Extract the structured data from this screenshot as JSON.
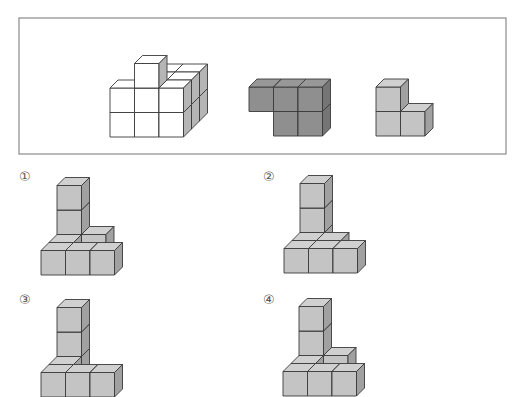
{
  "problem": {
    "given_box": {
      "x": 19,
      "y": 18,
      "width": 487,
      "height": 136,
      "stroke": "#8a8a8a"
    },
    "cube": {
      "width": 24.5,
      "height": 24.5,
      "depth_dx": 8,
      "depth_dy": 8
    },
    "given_pieces": [
      {
        "name": "white-pyramid-structure",
        "fill": "#ffffff",
        "origin": {
          "x": 110,
          "y": 137
        },
        "cubes": [
          [
            0,
            0,
            2
          ],
          [
            1,
            0,
            2
          ],
          [
            2,
            0,
            2
          ],
          [
            0,
            0,
            1
          ],
          [
            1,
            0,
            1
          ],
          [
            2,
            0,
            1
          ],
          [
            0,
            0,
            0
          ],
          [
            1,
            0,
            0
          ],
          [
            2,
            0,
            0
          ],
          [
            1,
            1,
            2
          ],
          [
            2,
            1,
            2
          ],
          [
            1,
            1,
            1
          ],
          [
            2,
            1,
            1
          ],
          [
            0,
            1,
            0
          ],
          [
            1,
            1,
            0
          ],
          [
            2,
            1,
            0
          ],
          [
            1,
            2,
            0
          ]
        ]
      },
      {
        "name": "dark-gray-piece",
        "fill": "#8f8f8f",
        "origin": {
          "x": 249,
          "y": 136
        },
        "cubes": [
          [
            1,
            0,
            0
          ],
          [
            2,
            0,
            0
          ],
          [
            0,
            1,
            0
          ],
          [
            1,
            1,
            0
          ],
          [
            2,
            1,
            0
          ]
        ]
      },
      {
        "name": "light-gray-piece",
        "fill": "#c4c4c4",
        "origin": {
          "x": 376,
          "y": 136
        },
        "cubes": [
          [
            0,
            0,
            0
          ],
          [
            1,
            0,
            0
          ],
          [
            0,
            1,
            0
          ]
        ]
      }
    ],
    "options": [
      {
        "label": "①",
        "label_pos": {
          "x": 19,
          "y": 170
        },
        "origin": {
          "x": 41,
          "y": 275
        },
        "cubes": [
          [
            0,
            0,
            2
          ],
          [
            1,
            0,
            2
          ],
          [
            0,
            1,
            2
          ],
          [
            0,
            2,
            2
          ],
          [
            0,
            0,
            1
          ],
          [
            0,
            0,
            0
          ],
          [
            1,
            0,
            0
          ],
          [
            2,
            0,
            0
          ]
        ]
      },
      {
        "label": "②",
        "label_pos": {
          "x": 263,
          "y": 170
        },
        "origin": {
          "x": 284,
          "y": 273
        },
        "cubes": [
          [
            0,
            0,
            2
          ],
          [
            0,
            1,
            2
          ],
          [
            0,
            2,
            2
          ],
          [
            0,
            0,
            1
          ],
          [
            1,
            0,
            1
          ],
          [
            0,
            0,
            0
          ],
          [
            1,
            0,
            0
          ],
          [
            2,
            0,
            0
          ]
        ]
      },
      {
        "label": "③",
        "label_pos": {
          "x": 19,
          "y": 293
        },
        "origin": {
          "x": 41,
          "y": 397
        },
        "cubes": [
          [
            0,
            0,
            2
          ],
          [
            0,
            1,
            2
          ],
          [
            0,
            2,
            2
          ],
          [
            0,
            0,
            1
          ],
          [
            0,
            0,
            0
          ],
          [
            1,
            0,
            0
          ],
          [
            2,
            0,
            0
          ]
        ]
      },
      {
        "label": "④",
        "label_pos": {
          "x": 263,
          "y": 293
        },
        "origin": {
          "x": 283,
          "y": 396
        },
        "cubes": [
          [
            0,
            0,
            2
          ],
          [
            1,
            0,
            2
          ],
          [
            0,
            1,
            2
          ],
          [
            0,
            2,
            2
          ],
          [
            0,
            0,
            1
          ],
          [
            0,
            0,
            0
          ],
          [
            1,
            0,
            0
          ],
          [
            2,
            0,
            0
          ]
        ]
      }
    ],
    "option_fill": "#c4c4c4",
    "edge_color": "#3a3a3a"
  }
}
